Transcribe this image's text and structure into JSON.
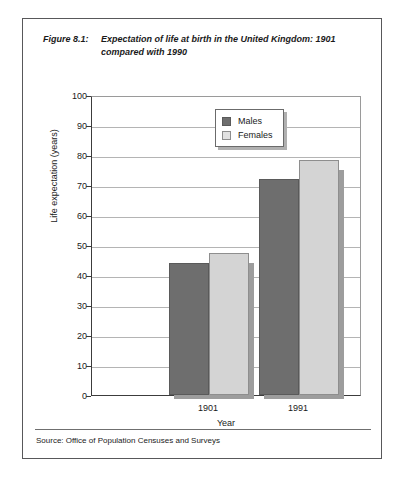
{
  "figure": {
    "number": "Figure 8.1:",
    "caption": "Expectation of life at birth in the United Kingdom: 1901 compared with 1990",
    "source": "Source: Office of Population Censuses and Surveys"
  },
  "colors": {
    "males": "#6e6e6e",
    "females": "#d4d4d4",
    "shadow": "#9d9d9d",
    "gridline": "#b4b4b4",
    "axis": "#3c3c3c",
    "frame": "#58585a"
  },
  "chart_data": {
    "type": "bar",
    "title": "Expectation of life at birth in the United Kingdom: 1901 compared with 1990",
    "categories": [
      "1901",
      "1991"
    ],
    "series": [
      {
        "name": "Males",
        "values": [
          44,
          72
        ]
      },
      {
        "name": "Females",
        "values": [
          47.5,
          78.5
        ]
      }
    ],
    "xlabel": "Year",
    "ylabel": "Life expectation (years)",
    "ylim": [
      0,
      100
    ],
    "yticks": [
      0,
      10,
      20,
      30,
      40,
      50,
      60,
      70,
      80,
      90,
      100
    ],
    "ytick_labels": [
      "0",
      "10",
      "20",
      "30",
      "40",
      "50",
      "60",
      "70",
      "80",
      "90",
      "100"
    ],
    "grid": true,
    "legend_position": "top-center",
    "legend_entries": [
      "Males",
      "Females"
    ]
  }
}
